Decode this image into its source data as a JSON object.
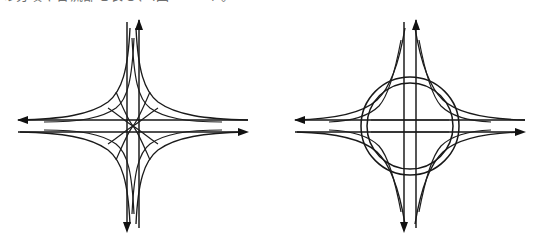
{
  "caption": {
    "text": "の分岐や合流部を表し、(図 2-3-1) 。"
  },
  "figure": {
    "background_color": "#ffffff",
    "ink_color": "#161616",
    "panels": [
      {
        "id": "left",
        "name": "turbine-interchange-diagram",
        "label": "",
        "center": {
          "x": 125,
          "y": 114
        },
        "mainline_horizontal": {
          "y_upper": 108,
          "y_lower": 120
        },
        "mainline_vertical": {
          "x_left": 119,
          "x_right": 131
        },
        "ramp_style": "crossing-curved-ramps",
        "ring": false,
        "arrows": [
          {
            "name": "arrow-west",
            "direction": "left",
            "x": 10,
            "y": 108
          },
          {
            "name": "arrow-east",
            "direction": "right",
            "x": 240,
            "y": 120
          },
          {
            "name": "arrow-north",
            "direction": "up",
            "x": 131,
            "y": 8
          },
          {
            "name": "arrow-south",
            "direction": "down",
            "x": 119,
            "y": 220
          }
        ]
      },
      {
        "id": "right",
        "name": "roundabout-interchange-diagram",
        "label": "",
        "center": {
          "x": 125,
          "y": 114
        },
        "mainline_horizontal": {
          "y_upper": 108,
          "y_lower": 120
        },
        "mainline_vertical": {
          "x_left": 119,
          "x_right": 131
        },
        "ramp_style": "flared-ramps-into-ring",
        "ring": true,
        "ring_radius_outer": 49,
        "ring_radius_inner": 43,
        "arrows": [
          {
            "name": "arrow-west",
            "direction": "left",
            "x": 10,
            "y": 108
          },
          {
            "name": "arrow-east",
            "direction": "right",
            "x": 240,
            "y": 120
          },
          {
            "name": "arrow-north",
            "direction": "up",
            "x": 131,
            "y": 8
          },
          {
            "name": "arrow-south",
            "direction": "down",
            "x": 119,
            "y": 220
          }
        ]
      }
    ]
  }
}
